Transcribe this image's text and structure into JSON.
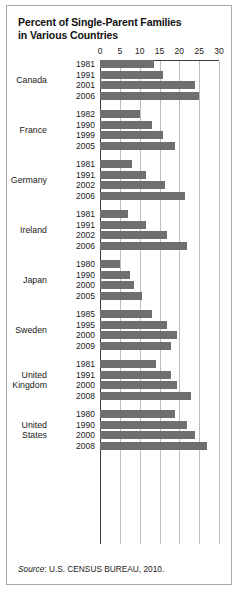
{
  "figure": {
    "title_line1": "Percent of Single-Parent Families",
    "title_line2": "in Various Countries",
    "source_prefix": "Source",
    "source_text": ": U.S. CENSUS BUREAU, 2010.",
    "bar_color": "#6f6f6f",
    "grid_color": "#bcbcbc",
    "axis_color": "#3a3a3a",
    "border_color": "#a8a8a8"
  },
  "chart_data": {
    "type": "bar",
    "orientation": "horizontal",
    "title": "Percent of Single-Parent Families in Various Countries",
    "xlabel": "",
    "ylabel": "",
    "xlim": [
      0,
      30
    ],
    "xticks": [
      0,
      5,
      10,
      15,
      20,
      25,
      30
    ],
    "xtick_labels": [
      "0",
      "5",
      "10",
      "15",
      "20",
      "25",
      "30"
    ],
    "grid": true,
    "legend": "none",
    "source": "Source: U.S. CENSUS BUREAU, 2010.",
    "groups": [
      {
        "country": "Canada",
        "country_lines": [
          "Canada"
        ],
        "categories": [
          "1981",
          "1991",
          "2001",
          "2006"
        ],
        "values": [
          13.5,
          16,
          24,
          25
        ]
      },
      {
        "country": "France",
        "country_lines": [
          "France"
        ],
        "categories": [
          "1982",
          "1990",
          "1999",
          "2005"
        ],
        "values": [
          10,
          13,
          16,
          19
        ]
      },
      {
        "country": "Germany",
        "country_lines": [
          "Germany"
        ],
        "categories": [
          "1981",
          "1991",
          "2002",
          "2006"
        ],
        "values": [
          8,
          11.5,
          16.5,
          21.5
        ]
      },
      {
        "country": "Ireland",
        "country_lines": [
          "Ireland"
        ],
        "categories": [
          "1981",
          "1991",
          "2002",
          "2006"
        ],
        "values": [
          7,
          11.5,
          17,
          22
        ]
      },
      {
        "country": "Japan",
        "country_lines": [
          "Japan"
        ],
        "categories": [
          "1980",
          "1990",
          "2000",
          "2005"
        ],
        "values": [
          5,
          7.5,
          8.5,
          10.5
        ]
      },
      {
        "country": "Sweden",
        "country_lines": [
          "Sweden"
        ],
        "categories": [
          "1985",
          "1995",
          "2000",
          "2009"
        ],
        "values": [
          13,
          17,
          19.5,
          18
        ]
      },
      {
        "country": "United Kingdom",
        "country_lines": [
          "United",
          "Kingdom"
        ],
        "categories": [
          "1981",
          "1991",
          "2000",
          "2008"
        ],
        "values": [
          14,
          18,
          19.5,
          23
        ]
      },
      {
        "country": "United States",
        "country_lines": [
          "United",
          "States"
        ],
        "categories": [
          "1980",
          "1990",
          "2000",
          "2008"
        ],
        "values": [
          19,
          22,
          24,
          27
        ]
      }
    ]
  }
}
